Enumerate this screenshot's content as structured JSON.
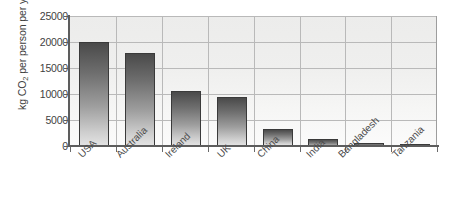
{
  "chart_data": {
    "type": "bar",
    "title": "",
    "subtitle": "",
    "xlabel": "",
    "ylabel": "kg CO2 per person per year",
    "ylabel_parts": {
      "prefix": "kg CO",
      "subscript": "2",
      "suffix": " per person per year"
    },
    "categories": [
      "USA",
      "Australia",
      "Ireland",
      "UK",
      "China",
      "India",
      "Bangladesh",
      "Tanzania"
    ],
    "values": [
      20000,
      17800,
      10500,
      9400,
      3200,
      1300,
      500,
      300
    ],
    "ylim": [
      0,
      25000
    ],
    "y_ticks": [
      0,
      5000,
      10000,
      15000,
      20000,
      25000
    ],
    "y_tick_labels": [
      "0",
      "5000",
      "10000",
      "15000",
      "20000",
      "25000"
    ],
    "grid": "horizontal-and-vertical",
    "legend": "none",
    "legend_position": "none",
    "bar_fill": "gradient-dark-to-light-gray",
    "plot_background": "#efefee",
    "axis_color": "#5d5d5d",
    "grid_color": "#b9b9b9"
  },
  "axis": {
    "y_title": "kg CO",
    "y_title_sub": "2",
    "y_title_rest": " per person per year"
  },
  "ticks": {
    "t0": "0",
    "t1": "5000",
    "t2": "10000",
    "t3": "15000",
    "t4": "20000",
    "t5": "25000"
  },
  "labels": {
    "c0": "USA",
    "c1": "Australia",
    "c2": "Ireland",
    "c3": "UK",
    "c4": "China",
    "c5": "India",
    "c6": "Bangladesh",
    "c7": "Tanzania"
  }
}
